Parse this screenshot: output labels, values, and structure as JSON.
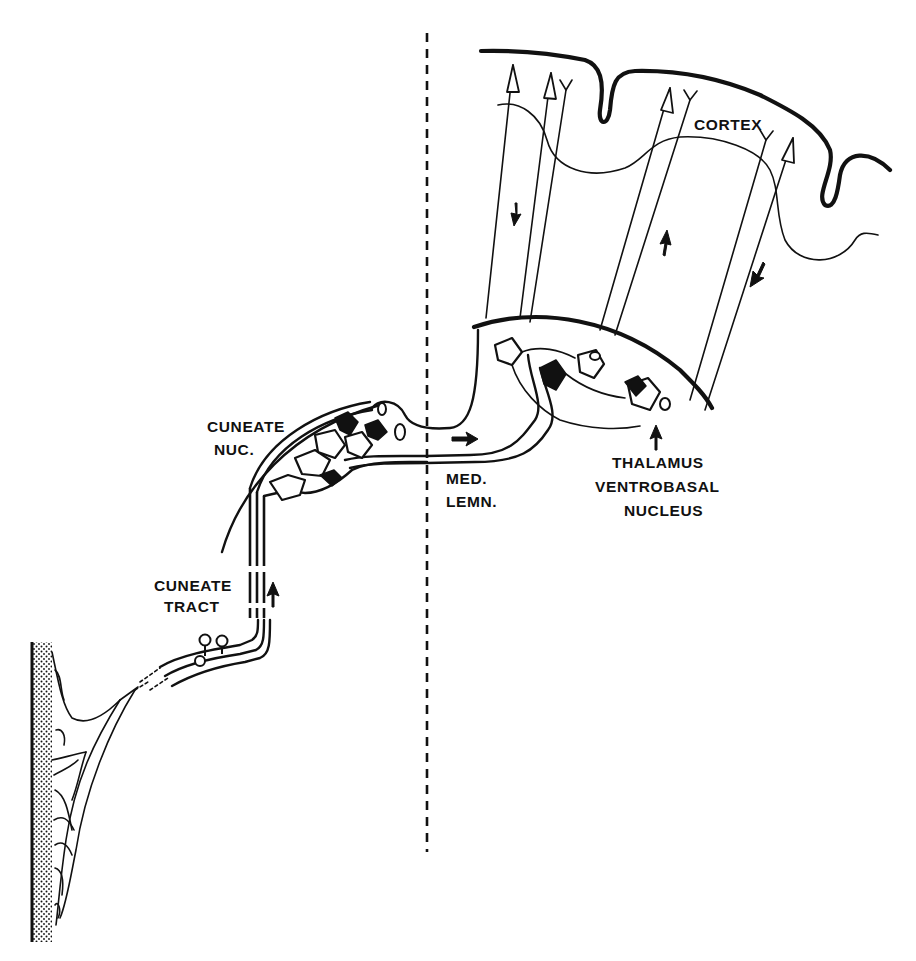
{
  "diagram": {
    "type": "neuroanatomy pathway (dorsal column - medial lemniscus)",
    "labels": {
      "cortex": "CORTEX",
      "cuneate_nucleus_line1": "CUNEATE",
      "cuneate_nucleus_line2": "NUC.",
      "cuneate_tract_line1": "CUNEATE",
      "cuneate_tract_line2": "TRACT",
      "medial_lemniscus_line1": "MED.",
      "medial_lemniscus_line2": "LEMN.",
      "thalamus_line1": "THALAMUS",
      "thalamus_line2": "VENTROBASAL",
      "thalamus_line3": "NUCLEUS"
    },
    "structures": [
      "skin (stippled) with peripheral nerve branches",
      "dorsal root ganglion cells",
      "cuneate tract (ascending)",
      "cuneate nucleus",
      "medial lemniscus crossing midline",
      "thalamus ventrobasal nucleus",
      "thalamocortical and corticothalamic fibers",
      "cortex"
    ],
    "direction_arrows": [
      {
        "location": "cuneate tract",
        "direction": "up"
      },
      {
        "location": "medial lemniscus",
        "direction": "right"
      },
      {
        "location": "thalamus",
        "direction": "up"
      },
      {
        "location": "cortex left fiber",
        "direction": "down"
      },
      {
        "location": "cortex middle fiber",
        "direction": "up"
      },
      {
        "location": "cortex right fiber",
        "direction": "down-left"
      }
    ],
    "midline": "dashed vertical line",
    "colors": {
      "ink": "#111111",
      "background": "#ffffff"
    }
  }
}
